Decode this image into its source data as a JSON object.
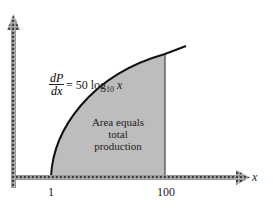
{
  "diagram": {
    "equation": {
      "lhs_num": "dP",
      "lhs_den": "dx",
      "rhs_prefix": "= 50 log",
      "rhs_sub": "10",
      "rhs_var": "x"
    },
    "area_label": [
      "Area equals",
      "total",
      "production"
    ],
    "x_axis_label": "x",
    "x_ticks": [
      "1",
      "100"
    ],
    "colors": {
      "fill": "#bdbdbd",
      "curve": "#111111",
      "axis": "#888888"
    }
  }
}
